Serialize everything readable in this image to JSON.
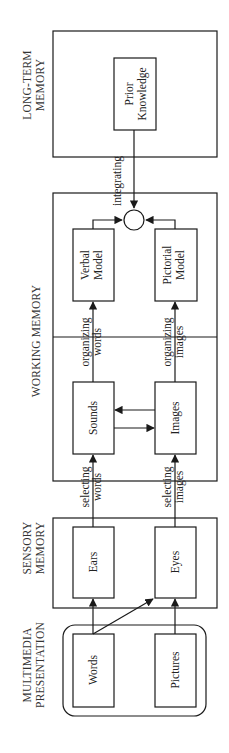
{
  "diagram": {
    "orientation": "rotated-90-ccw",
    "sections": {
      "multimedia": "MULTIMEDIA",
      "presentation": "PRESENTATION",
      "sensory": "SENSORY",
      "sensory_memory": "MEMORY",
      "working_memory": "WORKING MEMORY",
      "long_term": "LONG-TERM",
      "long_term_memory": "MEMORY"
    },
    "nodes": {
      "words": "Words",
      "pictures": "Pictures",
      "ears": "Ears",
      "eyes": "Eyes",
      "sounds": "Sounds",
      "images": "Images",
      "verbal_1": "Verbal",
      "verbal_2": "Model",
      "pictorial_1": "Pictorial",
      "pictorial_2": "Model",
      "prior_1": "Prior",
      "prior_2": "Knowledge"
    },
    "processes": {
      "selecting_words_1": "selecting",
      "selecting_words_2": "words",
      "selecting_images_1": "selecting",
      "selecting_images_2": "images",
      "organizing_words_1": "organizing",
      "organizing_words_2": "words",
      "organizing_images_1": "organizing",
      "organizing_images_2": "images",
      "integrating": "integrating"
    },
    "colors": {
      "stroke": "#1a1a1a",
      "background": "#ffffff"
    }
  }
}
